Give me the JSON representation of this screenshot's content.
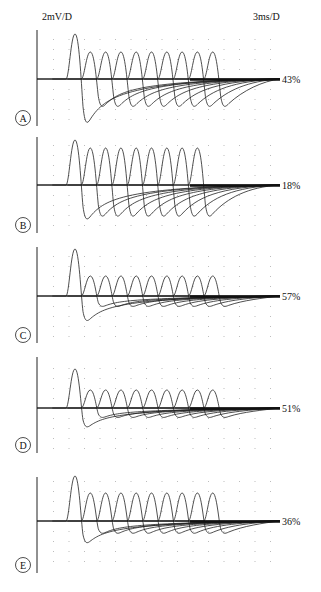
{
  "chart_data": {
    "type": "line",
    "scale": {
      "vertical": "2mV/D",
      "horizontal": "3ms/D"
    },
    "grid": true,
    "panels": [
      {
        "label": "A",
        "decrement_label": "43%",
        "n_responses": 10,
        "first_peak_mV": 9.0,
        "later_peak_mV": 5.4,
        "first_trough_mV": -9.2,
        "later_trough_mV": -5.8
      },
      {
        "label": "B",
        "decrement_label": "18%",
        "n_responses": 9,
        "first_peak_mV": 9.0,
        "later_peak_mV": 7.4,
        "first_trough_mV": -7.2,
        "later_trough_mV": -6.6
      },
      {
        "label": "C",
        "decrement_label": "57%",
        "n_responses": 10,
        "first_peak_mV": 9.4,
        "later_peak_mV": 4.0,
        "first_trough_mV": -5.2,
        "later_trough_mV": -2.2
      },
      {
        "label": "D",
        "decrement_label": "51%",
        "n_responses": 10,
        "first_peak_mV": 7.8,
        "later_peak_mV": 3.6,
        "first_trough_mV": -4.0,
        "later_trough_mV": -2.0
      },
      {
        "label": "E",
        "decrement_label": "36%",
        "n_responses": 10,
        "first_peak_mV": 9.0,
        "later_peak_mV": 5.6,
        "first_trough_mV": -4.6,
        "later_trough_mV": -2.6
      }
    ],
    "xlabel": "",
    "ylabel": "",
    "legend": "none"
  }
}
